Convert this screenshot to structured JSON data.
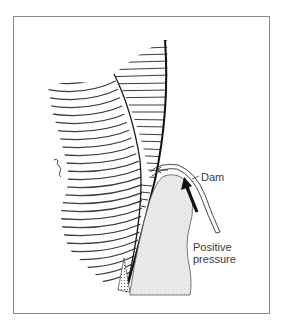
{
  "diagram": {
    "type": "anatomical cross-section illustration",
    "labels": {
      "dam": "Dam",
      "positive_pressure_line1": "Positive",
      "positive_pressure_line2": "pressure"
    },
    "elements": [
      {
        "name": "hatched-tissue-left",
        "style": "curved diagonal hatching"
      },
      {
        "name": "hatched-tissue-right",
        "style": "horizontal hatching"
      },
      {
        "name": "tooth-body",
        "style": "stippled gray fill"
      },
      {
        "name": "dam-sheet",
        "style": "double outline curve"
      },
      {
        "name": "pressure-arrow",
        "style": "bold black arrow pointing up"
      },
      {
        "name": "small-arrow",
        "style": "thin arrow pointing left into gap"
      }
    ],
    "colors": {
      "line": "#1a1a1a",
      "hatch": "#444444",
      "tooth_fill": "#e6e6e6",
      "frame": "#8a8a8a",
      "text": "#3a3a3a"
    }
  }
}
